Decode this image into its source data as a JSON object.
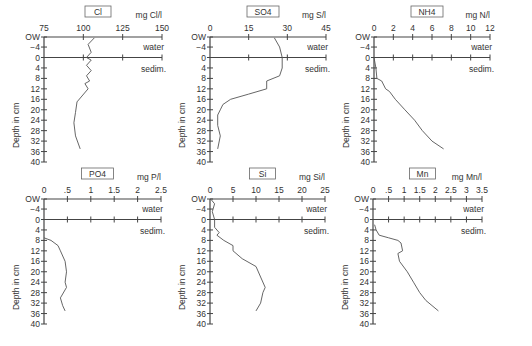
{
  "chart_data": [
    {
      "type": "line",
      "title": "Cl",
      "unit": "mg Cl/l",
      "xticks": [
        75,
        100,
        125,
        150
      ],
      "xlim": [
        75,
        150
      ],
      "ylabel": "Depth in cm",
      "yticks": [
        "OW",
        "-4",
        "0",
        "4",
        "8",
        "12",
        "16",
        "20",
        "24",
        "28",
        "32",
        "36",
        "40"
      ],
      "labels": {
        "water": "water",
        "sediment": "sedim."
      },
      "series": [
        {
          "name": "Cl",
          "points": [
            [
              107,
              -7.5
            ],
            [
              103,
              -5
            ],
            [
              105,
              -2
            ],
            [
              102,
              0
            ],
            [
              105,
              1
            ],
            [
              102,
              3
            ],
            [
              105,
              5
            ],
            [
              102,
              7
            ],
            [
              104,
              9
            ],
            [
              101,
              10
            ],
            [
              103,
              12
            ],
            [
              96,
              17
            ],
            [
              95,
              21
            ],
            [
              94,
              25
            ],
            [
              95,
              30
            ],
            [
              98,
              35
            ]
          ]
        }
      ]
    },
    {
      "type": "line",
      "title": "SO4",
      "unit": "mg S/l",
      "xticks": [
        0,
        15,
        30,
        45
      ],
      "xlim": [
        0,
        45
      ],
      "ylabel": "Depth in cm",
      "yticks": [
        "OW",
        "-4",
        "0",
        "4",
        "8",
        "12",
        "16",
        "20",
        "24",
        "28",
        "32",
        "36",
        "40"
      ],
      "labels": {
        "water": "water",
        "sediment": "sedim."
      },
      "series": [
        {
          "name": "SO4",
          "points": [
            [
              25,
              -7.5
            ],
            [
              27,
              -4
            ],
            [
              28,
              0
            ],
            [
              28,
              4
            ],
            [
              27,
              7
            ],
            [
              22,
              9
            ],
            [
              22,
              12
            ],
            [
              15,
              14
            ],
            [
              8,
              16
            ],
            [
              5,
              18
            ],
            [
              4,
              20
            ],
            [
              3,
              22
            ],
            [
              3,
              26
            ],
            [
              4,
              30
            ],
            [
              3,
              35
            ]
          ]
        }
      ]
    },
    {
      "type": "line",
      "title": "NH4",
      "unit": "mg N/l",
      "xticks": [
        0,
        2,
        4,
        6,
        8,
        10,
        12
      ],
      "xlim": [
        0,
        12
      ],
      "ylabel": "Depth in cm",
      "yticks": [
        "OW",
        "-4",
        "0",
        "4",
        "8",
        "12",
        "16",
        "20",
        "24",
        "28",
        "32",
        "36",
        "40"
      ],
      "labels": {
        "water": "water",
        "sediment": "sedim."
      },
      "series": [
        {
          "name": "NH4",
          "points": [
            [
              0,
              0
            ],
            [
              0.2,
              4
            ],
            [
              0.3,
              8
            ],
            [
              0.8,
              9
            ],
            [
              1.2,
              12
            ],
            [
              1.6,
              13
            ],
            [
              2.2,
              16
            ],
            [
              3.2,
              20
            ],
            [
              4.2,
              24
            ],
            [
              5,
              28
            ],
            [
              6,
              32
            ],
            [
              7.2,
              35
            ]
          ]
        }
      ]
    },
    {
      "type": "line",
      "title": "PO4",
      "unit": "mg P/l",
      "xticks": [
        "0",
        ".5",
        "1",
        "1.5",
        "2",
        "2.5"
      ],
      "xlim": [
        0,
        2.5
      ],
      "ylabel": "Depth in cm",
      "yticks": [
        "OW",
        "-4",
        "0",
        "4",
        "8",
        "12",
        "16",
        "20",
        "24",
        "28",
        "32",
        "36",
        "40"
      ],
      "labels": {
        "water": "water",
        "sediment": "sedim."
      },
      "series": [
        {
          "name": "PO4",
          "points": [
            [
              0,
              7
            ],
            [
              0.15,
              8
            ],
            [
              0.3,
              10
            ],
            [
              0.35,
              12
            ],
            [
              0.45,
              16
            ],
            [
              0.48,
              20
            ],
            [
              0.45,
              24
            ],
            [
              0.48,
              26
            ],
            [
              0.35,
              30
            ],
            [
              0.4,
              33
            ],
            [
              0.45,
              35
            ]
          ]
        }
      ]
    },
    {
      "type": "line",
      "title": "Si",
      "unit": "mg Si/l",
      "xticks": [
        0,
        5,
        10,
        15,
        20,
        25
      ],
      "xlim": [
        0,
        25
      ],
      "ylabel": "Depth in cm",
      "yticks": [
        "OW",
        "-4",
        "0",
        "4",
        "8",
        "12",
        "16",
        "20",
        "24",
        "28",
        "32",
        "36",
        "40"
      ],
      "labels": {
        "water": "water",
        "sediment": "sedim."
      },
      "series": [
        {
          "name": "Si",
          "points": [
            [
              0.3,
              -7.5
            ],
            [
              1,
              -6
            ],
            [
              0.5,
              -3
            ],
            [
              1,
              0
            ],
            [
              1,
              3
            ],
            [
              2,
              5
            ],
            [
              1.5,
              6
            ],
            [
              3,
              8
            ],
            [
              5,
              10
            ],
            [
              5,
              12
            ],
            [
              7,
              15
            ],
            [
              10,
              18
            ],
            [
              11,
              22
            ],
            [
              12,
              26
            ],
            [
              11.5,
              28
            ],
            [
              11,
              32
            ],
            [
              10,
              35
            ]
          ]
        }
      ]
    },
    {
      "type": "line",
      "title": "Mn",
      "unit": "mg Mn/l",
      "xticks": [
        "0",
        ".5",
        "1",
        "1.5",
        "2",
        "2.5",
        "3",
        "3.5"
      ],
      "xlim": [
        0,
        3.5
      ],
      "ylabel": "Depth in cm",
      "yticks": [
        "OW",
        "-4",
        "0",
        "4",
        "8",
        "12",
        "16",
        "20",
        "24",
        "28",
        "32",
        "36",
        "40"
      ],
      "labels": {
        "water": "water",
        "sediment": "sedim."
      },
      "series": [
        {
          "name": "Mn",
          "points": [
            [
              0.05,
              2
            ],
            [
              0.1,
              4
            ],
            [
              0.2,
              6
            ],
            [
              0.5,
              7
            ],
            [
              0.8,
              8
            ],
            [
              0.9,
              9
            ],
            [
              0.95,
              12
            ],
            [
              0.8,
              13
            ],
            [
              0.85,
              16
            ],
            [
              1.1,
              20
            ],
            [
              1.3,
              24
            ],
            [
              1.5,
              28
            ],
            [
              1.7,
              31
            ],
            [
              2.1,
              35
            ]
          ]
        }
      ]
    }
  ]
}
